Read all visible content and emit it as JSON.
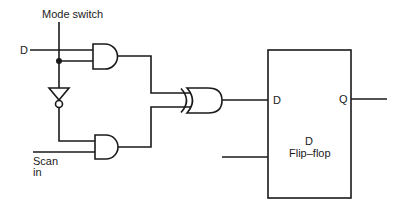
{
  "diagram": {
    "type": "logic-circuit",
    "labels": {
      "mode_switch": "Mode switch",
      "d_input": "D",
      "scan_in_line1": "Scan",
      "scan_in_line2": "in",
      "ff_d_pin": "D",
      "ff_q_pin": "Q",
      "ff_name_line1": "D",
      "ff_name_line2": "Flip–flop"
    },
    "components": [
      {
        "id": "and1",
        "type": "AND",
        "inputs": [
          "D",
          "Mode switch"
        ]
      },
      {
        "id": "inv1",
        "type": "NOT",
        "inputs": [
          "Mode switch"
        ]
      },
      {
        "id": "and2",
        "type": "AND",
        "inputs": [
          "NOT Mode switch",
          "Scan in"
        ]
      },
      {
        "id": "or1",
        "type": "OR",
        "inputs": [
          "and1",
          "and2"
        ]
      },
      {
        "id": "dff",
        "type": "D Flip-flop",
        "inputs": [
          "or1 -> D",
          "clock"
        ],
        "outputs": [
          "Q"
        ]
      }
    ],
    "colors": {
      "line": "#1a1a1a",
      "background": "#ffffff"
    }
  }
}
